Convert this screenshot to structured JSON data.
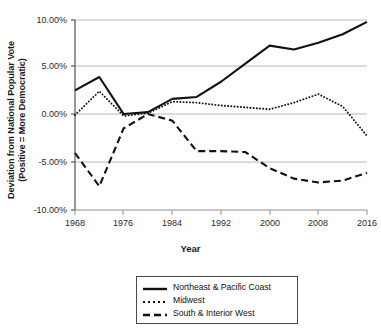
{
  "chart_data": {
    "type": "line",
    "title": "",
    "xlabel": "Year",
    "ylabel": "Deviation from National Popular Vote (Positive = More Democratic)",
    "ylabel_line1": "Deviation from National Popular Vote",
    "ylabel_line2": "(Positive = More Democratic)",
    "x": [
      1968,
      1972,
      1976,
      1980,
      1984,
      1988,
      1992,
      1996,
      2000,
      2004,
      2008,
      2012,
      2016
    ],
    "xticks": [
      "1968",
      "1976",
      "1984",
      "1992",
      "2000",
      "2008",
      "2016"
    ],
    "xtick_values": [
      1968,
      1976,
      1984,
      1992,
      2000,
      2008,
      2016
    ],
    "yticks": [
      "10.00%",
      "5.00%",
      "0.00%",
      "-5.00%",
      "-10.00%"
    ],
    "ytick_values": [
      10,
      5,
      0,
      -5,
      -10
    ],
    "xlim": [
      1968,
      2016
    ],
    "ylim": [
      -10,
      10
    ],
    "grid": "horizontal",
    "legend_position": "below-axes",
    "series": [
      {
        "name": "Northeast & Pacific Coast",
        "style": "solid",
        "color": "#111111",
        "values": [
          2.6,
          4.0,
          0.1,
          0.3,
          1.7,
          1.9,
          3.5,
          5.4,
          7.3,
          6.9,
          7.6,
          8.5,
          9.8
        ]
      },
      {
        "name": "Midwest",
        "style": "dotted",
        "color": "#111111",
        "values": [
          0.0,
          2.5,
          -0.1,
          0.2,
          1.4,
          1.3,
          1.0,
          0.8,
          0.6,
          1.3,
          2.2,
          0.9,
          -2.2
        ]
      },
      {
        "name": "South & Interior West",
        "style": "dashed",
        "color": "#111111",
        "values": [
          -4.0,
          -7.5,
          -1.4,
          0.1,
          -0.6,
          -3.8,
          -3.8,
          -3.9,
          -5.6,
          -6.7,
          -7.1,
          -6.9,
          -6.1
        ]
      }
    ]
  },
  "legend": {
    "items": [
      {
        "label": "Northeast & Pacific Coast",
        "style": "solid"
      },
      {
        "label": "Midwest",
        "style": "dotted"
      },
      {
        "label": "South & Interior West",
        "style": "dashed"
      }
    ]
  }
}
